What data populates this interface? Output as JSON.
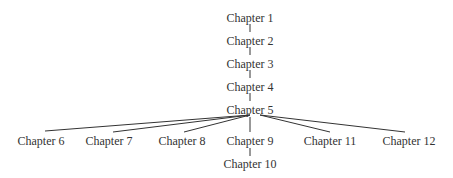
{
  "diagram": {
    "type": "tree",
    "line_color": "#333333",
    "text_color": "#333333",
    "nodes": [
      {
        "id": "ch1",
        "label": "Chapter 1",
        "x": 250,
        "y": 12
      },
      {
        "id": "ch2",
        "label": "Chapter 2",
        "x": 250,
        "y": 35
      },
      {
        "id": "ch3",
        "label": "Chapter 3",
        "x": 250,
        "y": 58
      },
      {
        "id": "ch4",
        "label": "Chapter 4",
        "x": 250,
        "y": 81
      },
      {
        "id": "ch5",
        "label": "Chapter 5",
        "x": 250,
        "y": 104
      },
      {
        "id": "ch6",
        "label": "Chapter 6",
        "x": 41,
        "y": 135
      },
      {
        "id": "ch7",
        "label": "Chapter 7",
        "x": 109,
        "y": 135
      },
      {
        "id": "ch8",
        "label": "Chapter 8",
        "x": 182,
        "y": 135
      },
      {
        "id": "ch9",
        "label": "Chapter 9",
        "x": 250,
        "y": 135
      },
      {
        "id": "ch11",
        "label": "Chapter 11",
        "x": 330,
        "y": 135
      },
      {
        "id": "ch12",
        "label": "Chapter 12",
        "x": 409,
        "y": 135
      },
      {
        "id": "ch10",
        "label": "Chapter 10",
        "x": 250,
        "y": 158
      }
    ],
    "edges": [
      {
        "from": "ch1",
        "to": "ch2"
      },
      {
        "from": "ch2",
        "to": "ch3"
      },
      {
        "from": "ch3",
        "to": "ch4"
      },
      {
        "from": "ch4",
        "to": "ch5"
      },
      {
        "from": "ch5",
        "to": "ch6"
      },
      {
        "from": "ch5",
        "to": "ch7"
      },
      {
        "from": "ch5",
        "to": "ch8"
      },
      {
        "from": "ch5",
        "to": "ch9"
      },
      {
        "from": "ch5",
        "to": "ch11"
      },
      {
        "from": "ch5",
        "to": "ch12"
      },
      {
        "from": "ch9",
        "to": "ch10"
      }
    ]
  }
}
